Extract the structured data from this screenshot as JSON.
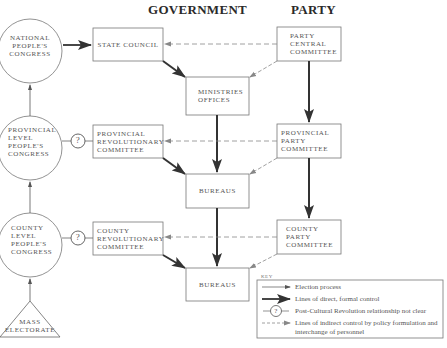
{
  "headings": {
    "government": "GOVERNMENT",
    "party": "PARTY"
  },
  "congresses": [
    {
      "id": "national",
      "label": "NATIONAL\nPEOPLE'S\nCONGRESS"
    },
    {
      "id": "provincial",
      "label": "PROVINCIAL\nLEVEL\nPEOPLE'S\nCONGRESS"
    },
    {
      "id": "county",
      "label": "COUNTY\nLEVEL\nPEOPLE'S\nCONGRESS"
    }
  ],
  "electorate": {
    "label": "MASS\nELECTORATE"
  },
  "government_boxes": [
    {
      "id": "state-council",
      "label": "STATE COUNCIL"
    },
    {
      "id": "ministries",
      "label": "MINISTRIES\nOFFICES"
    },
    {
      "id": "provincial-rev",
      "label": "PROVINCIAL\nREVOLUTIONARY\nCOMMITTEE"
    },
    {
      "id": "bureaus-1",
      "label": "BUREAUS"
    },
    {
      "id": "county-rev",
      "label": "COUNTY\nREVOLUTIONARY\nCOMMITTEE"
    },
    {
      "id": "bureaus-2",
      "label": "BUREAUS"
    }
  ],
  "party_boxes": [
    {
      "id": "central",
      "label": "PARTY\nCENTRAL\nCOMMITTEE"
    },
    {
      "id": "provincial-party",
      "label": "PROVINCIAL\nPARTY\nCOMMITTEE"
    },
    {
      "id": "county-party",
      "label": "COUNTY\nPARTY\nCOMMITTEE"
    }
  ],
  "key": {
    "title": "KEY",
    "items": [
      {
        "symbol": "thin-arrow",
        "label": "Election process"
      },
      {
        "symbol": "thick-arrow",
        "label": "Lines of direct, formal control"
      },
      {
        "symbol": "question-circle",
        "label": "Post-Cultural Revolution relationship not clear"
      },
      {
        "symbol": "dashed-arrow",
        "label": "Lines of indirect control by policy formulation and\ninterchange of personnel"
      }
    ]
  },
  "question_mark": "?",
  "colors": {
    "line": "#555555",
    "thick": "#333333",
    "dashed": "#888888",
    "text": "#555555"
  }
}
